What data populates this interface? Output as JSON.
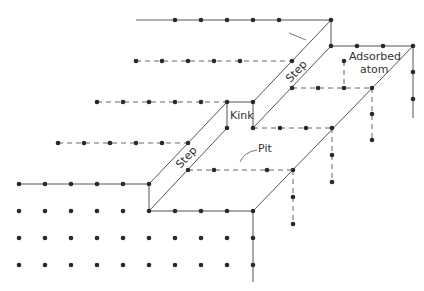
{
  "diagram": {
    "type": "crystal-surface-terraces",
    "labels": {
      "step_upper": "Step",
      "step_lower": "Step",
      "kink": "Kink",
      "pit": "Pit",
      "adsorbed_1": "Adsorbed",
      "adsorbed_2": "atom"
    },
    "colors": {
      "line": "#444444",
      "atom": "#2a2a2a",
      "text": "#333333",
      "background": "#ffffff"
    }
  }
}
